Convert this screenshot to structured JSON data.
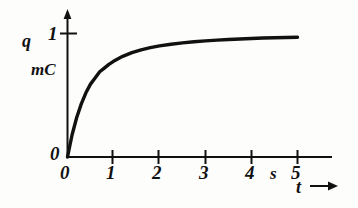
{
  "figure": {
    "background_color": "#fdfdfb",
    "ink_color": "#111111"
  },
  "axes": {
    "y": {
      "name": "q",
      "unit": "mC",
      "zero_label": "0",
      "tick_labels": [
        "1"
      ],
      "arrow": "up-arrow"
    },
    "x": {
      "name": "t",
      "unit": "s",
      "tick_labels": [
        "0",
        "1",
        "2",
        "3",
        "4",
        "5"
      ],
      "arrow": "right-arrow"
    }
  },
  "chart_data": {
    "type": "line",
    "title": "",
    "xlabel": "t",
    "ylabel": "q",
    "xunit": "s",
    "yunit": "mC",
    "xlim": [
      0,
      5
    ],
    "ylim": [
      0,
      1
    ],
    "xticks": [
      0,
      1,
      2,
      3,
      4,
      5
    ],
    "yticks": [
      0,
      1
    ],
    "grid": false,
    "legend": false,
    "series": [
      {
        "name": "q(t)",
        "x": [
          0.0,
          0.1,
          0.2,
          0.3,
          0.4,
          0.5,
          0.6,
          0.7,
          0.8,
          0.9,
          1.0,
          1.2,
          1.4,
          1.6,
          1.8,
          2.0,
          2.25,
          2.5,
          2.75,
          3.0,
          3.25,
          3.5,
          3.75,
          4.0,
          4.25,
          4.5,
          4.75,
          5.0
        ],
        "y": [
          0.0,
          0.18,
          0.32,
          0.43,
          0.52,
          0.59,
          0.64,
          0.69,
          0.72,
          0.75,
          0.775,
          0.815,
          0.845,
          0.868,
          0.885,
          0.9,
          0.913,
          0.924,
          0.933,
          0.94,
          0.946,
          0.951,
          0.956,
          0.96,
          0.963,
          0.966,
          0.968,
          0.97
        ]
      }
    ]
  }
}
